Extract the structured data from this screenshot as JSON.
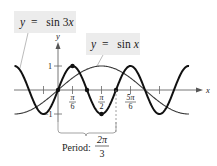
{
  "chart_data": {
    "type": "line",
    "title": "",
    "xlabel": "x",
    "ylabel": "y",
    "xlim_radians": [
      -1.5708,
      4.9
    ],
    "ylim": [
      -1,
      1
    ],
    "x_ticks": [
      "-π/6",
      "π/6",
      "π/2",
      "5π/6",
      "7π/6"
    ],
    "x_tick_labels_shown": [
      "π/6",
      "π/2",
      "5π/6"
    ],
    "y_ticks": [
      -1,
      1
    ],
    "y_tick_labels": [
      "1",
      "−1"
    ],
    "series": [
      {
        "name": "y = sin 3x",
        "function": "sin(3x)",
        "style": "thick black",
        "x_range": "[-π/2, 3π/2]",
        "marked_points": [
          {
            "x": "0",
            "y": 0
          },
          {
            "x": "π/6",
            "y": 1
          },
          {
            "x": "π/3",
            "y": 0
          },
          {
            "x": "π/2",
            "y": -1
          },
          {
            "x": "2π/3",
            "y": 0
          }
        ]
      },
      {
        "name": "y = sin x",
        "function": "sin(x)",
        "style": "thin dark gray",
        "x_range": "[-π/2, 3π/2]"
      }
    ],
    "annotations": [
      {
        "text": "Period: 2π/3",
        "spans": "[0, 2π/3]",
        "type": "brace"
      }
    ],
    "grid": false,
    "legend": "callout labels"
  },
  "labels": {
    "sin3x": {
      "y": "y",
      "eq": "=",
      "fn": "sin 3",
      "var": "x"
    },
    "sinx": {
      "y": "y",
      "eq": "=",
      "fn": "sin",
      "var": "x"
    }
  },
  "axes": {
    "x_label": "x",
    "y_label": "y",
    "y_pos_tick": "1",
    "y_neg_tick": "−1"
  },
  "ticks": {
    "pi6": {
      "num": "π",
      "den": "6"
    },
    "pi2": {
      "num": "π",
      "den": "2"
    },
    "fivepi6": {
      "num": "5π",
      "den": "6"
    }
  },
  "period": {
    "label": "Period:",
    "num": "2π",
    "den": "3"
  },
  "colors": {
    "sin3x_curve": "#111111",
    "sinx_curve": "#333333",
    "axis": "#555555",
    "label_bg": "#ececec",
    "dashed": "#888888"
  }
}
